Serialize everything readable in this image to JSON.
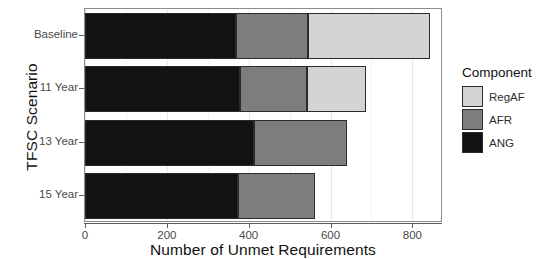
{
  "chart_data": {
    "type": "bar",
    "orientation": "horizontal",
    "stacked": true,
    "title": "",
    "xlabel": "Number of Unmet Requirements",
    "ylabel": "TFSC Scenario",
    "categories": [
      "Baseline",
      "11 Year",
      "13 Year",
      "15 Year"
    ],
    "xlim": [
      0,
      870
    ],
    "xticks": [
      0,
      200,
      400,
      600,
      800
    ],
    "xtick_labels": [
      "0",
      "200",
      "400",
      "600",
      "800"
    ],
    "grid": true,
    "legend_title": "Component",
    "legend_position": "right",
    "series": [
      {
        "name": "ANG",
        "color": "#121212",
        "values": [
          369,
          379,
          413,
          374
        ]
      },
      {
        "name": "AFR",
        "color": "#7d7d7d",
        "values": [
          176,
          163,
          228,
          188
        ]
      },
      {
        "name": "RegAF",
        "color": "#d4d4d4",
        "values": [
          299,
          144,
          0,
          0
        ]
      }
    ],
    "totals": [
      844,
      686,
      641,
      562
    ],
    "legend_order": [
      "RegAF",
      "AFR",
      "ANG"
    ]
  },
  "axes": {
    "y_title": "TFSC Scenario",
    "x_title": "Number of Unmet Requirements",
    "y_tick_labels": [
      "Baseline",
      "11 Year",
      "13 Year",
      "15 Year"
    ],
    "x_tick_labels": [
      "0",
      "200",
      "400",
      "600",
      "800"
    ]
  },
  "legend": {
    "title": "Component",
    "items": [
      {
        "label": "RegAF",
        "color": "#d4d4d4"
      },
      {
        "label": "AFR",
        "color": "#7d7d7d"
      },
      {
        "label": "ANG",
        "color": "#121212"
      }
    ]
  },
  "colors": {
    "ang": "#121212",
    "afr": "#7d7d7d",
    "regaf": "#d4d4d4",
    "panel_border": "#8c8c8c",
    "axis": "#5d5d5d",
    "gridline": "#e8e8e8",
    "background": "#ffffff"
  }
}
